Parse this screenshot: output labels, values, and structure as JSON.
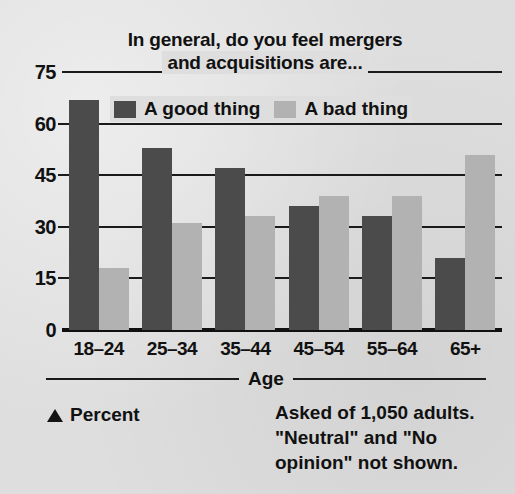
{
  "chart_data": {
    "type": "bar",
    "title": "In general, do you feel mergers and acquisitions are...",
    "title_line1": "In general, do you feel mergers",
    "title_line2": "and acquisitions are...",
    "categories": [
      "18–24",
      "25–34",
      "35–44",
      "45–54",
      "55–64",
      "65+"
    ],
    "series": [
      {
        "name": "A good thing",
        "values": [
          67,
          53,
          47,
          36,
          33,
          21
        ],
        "color": "#4b4b4b"
      },
      {
        "name": "A bad thing",
        "values": [
          18,
          31,
          33,
          39,
          39,
          51
        ],
        "color": "#b2b2b2"
      }
    ],
    "xlabel": "Age",
    "ylabel": "Percent",
    "yticks": [
      75,
      60,
      45,
      30,
      15,
      0
    ],
    "ylim": [
      0,
      75
    ],
    "grid": true,
    "legend_position": "top-inside"
  },
  "legend": {
    "items": [
      {
        "label": "A good thing",
        "color": "#4b4b4b"
      },
      {
        "label": "A bad thing",
        "color": "#b2b2b2"
      }
    ]
  },
  "axis": {
    "x_title": "Age",
    "y_unit_label": "Percent"
  },
  "footnote": {
    "line1": "Asked of 1,050 adults.",
    "line2": "\"Neutral\" and \"No",
    "line3": "opinion\" not shown."
  },
  "colors": {
    "background": "#dedede",
    "ink": "#141414",
    "good": "#4b4b4b",
    "bad": "#b2b2b2"
  }
}
